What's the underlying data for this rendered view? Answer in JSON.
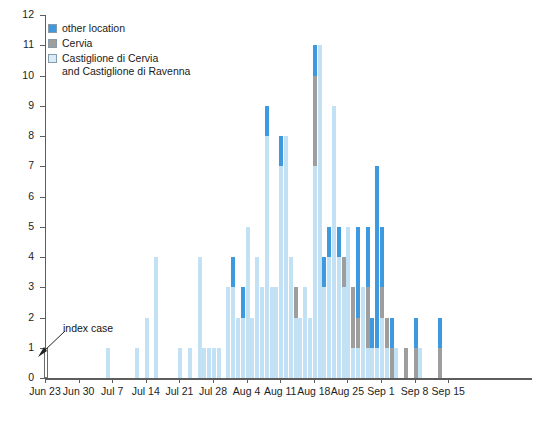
{
  "chart_data": {
    "type": "bar",
    "subtype": "stacked-epidemic-curve",
    "title": "",
    "xlabel": "",
    "ylabel": "number of case",
    "ylim": [
      0,
      12
    ],
    "ytick_values": [
      0,
      1,
      2,
      3,
      4,
      5,
      6,
      7,
      8,
      9,
      10,
      11,
      12
    ],
    "grid": false,
    "legend_position": "top-left",
    "x_start_date": "Jun 23",
    "x_tick_labels": [
      "Jun 23",
      "Jun 30",
      "Jul 7",
      "Jul 14",
      "Jul 21",
      "Jul 28",
      "Aug 4",
      "Aug 11",
      "Aug 18",
      "Aug 25",
      "Sep 1",
      "Sep 8",
      "Sep 15"
    ],
    "x_tick_day_indices": [
      0,
      7,
      14,
      21,
      28,
      35,
      42,
      49,
      56,
      63,
      70,
      77,
      84
    ],
    "series": [
      {
        "name": "Castiglione di Cervia and Castiglione di Ravenna",
        "color": "#c3e1f4"
      },
      {
        "name": "Cervia",
        "color": "#9e9e9e"
      },
      {
        "name": "other location",
        "color": "#3d9ae0"
      }
    ],
    "bars": [
      {
        "day": 0,
        "index_case": 1,
        "castiglione": 0,
        "cervia": 0,
        "other": 0
      },
      {
        "day": 13,
        "castiglione": 1,
        "cervia": 0,
        "other": 0
      },
      {
        "day": 19,
        "castiglione": 1,
        "cervia": 0,
        "other": 0
      },
      {
        "day": 21,
        "castiglione": 2,
        "cervia": 0,
        "other": 0
      },
      {
        "day": 23,
        "castiglione": 4,
        "cervia": 0,
        "other": 0
      },
      {
        "day": 28,
        "castiglione": 1,
        "cervia": 0,
        "other": 0
      },
      {
        "day": 30,
        "castiglione": 1,
        "cervia": 0,
        "other": 0
      },
      {
        "day": 32,
        "castiglione": 4,
        "cervia": 0,
        "other": 0
      },
      {
        "day": 33,
        "castiglione": 1,
        "cervia": 0,
        "other": 0
      },
      {
        "day": 34,
        "castiglione": 1,
        "cervia": 0,
        "other": 0
      },
      {
        "day": 35,
        "castiglione": 1,
        "cervia": 0,
        "other": 0
      },
      {
        "day": 36,
        "castiglione": 1,
        "cervia": 0,
        "other": 0
      },
      {
        "day": 38,
        "castiglione": 3,
        "cervia": 0,
        "other": 0
      },
      {
        "day": 39,
        "castiglione": 3,
        "cervia": 0,
        "other": 1
      },
      {
        "day": 40,
        "castiglione": 2,
        "cervia": 0,
        "other": 0
      },
      {
        "day": 41,
        "castiglione": 2,
        "cervia": 0,
        "other": 1
      },
      {
        "day": 42,
        "castiglione": 5,
        "cervia": 0,
        "other": 0
      },
      {
        "day": 43,
        "castiglione": 2,
        "cervia": 0,
        "other": 0
      },
      {
        "day": 44,
        "castiglione": 4,
        "cervia": 0,
        "other": 0
      },
      {
        "day": 45,
        "castiglione": 3,
        "cervia": 0,
        "other": 0
      },
      {
        "day": 46,
        "castiglione": 8,
        "cervia": 0,
        "other": 1
      },
      {
        "day": 47,
        "castiglione": 3,
        "cervia": 0,
        "other": 0
      },
      {
        "day": 48,
        "castiglione": 3,
        "cervia": 0,
        "other": 0
      },
      {
        "day": 49,
        "castiglione": 7,
        "cervia": 0,
        "other": 1
      },
      {
        "day": 50,
        "castiglione": 8,
        "cervia": 0,
        "other": 0
      },
      {
        "day": 51,
        "castiglione": 4,
        "cervia": 0,
        "other": 0
      },
      {
        "day": 52,
        "castiglione": 2,
        "cervia": 1,
        "other": 0
      },
      {
        "day": 53,
        "castiglione": 2,
        "cervia": 0,
        "other": 0
      },
      {
        "day": 54,
        "castiglione": 3,
        "cervia": 0,
        "other": 0
      },
      {
        "day": 55,
        "castiglione": 2,
        "cervia": 0,
        "other": 0
      },
      {
        "day": 56,
        "castiglione": 7,
        "cervia": 3,
        "other": 1
      },
      {
        "day": 57,
        "castiglione": 11,
        "cervia": 0,
        "other": 0
      },
      {
        "day": 58,
        "castiglione": 3,
        "cervia": 0,
        "other": 1
      },
      {
        "day": 59,
        "castiglione": 4,
        "cervia": 0,
        "other": 1
      },
      {
        "day": 60,
        "castiglione": 9,
        "cervia": 0,
        "other": 0
      },
      {
        "day": 61,
        "castiglione": 4,
        "cervia": 0,
        "other": 1
      },
      {
        "day": 62,
        "castiglione": 3,
        "cervia": 1,
        "other": 0
      },
      {
        "day": 63,
        "castiglione": 5,
        "cervia": 0,
        "other": 0
      },
      {
        "day": 64,
        "castiglione": 1,
        "cervia": 2,
        "other": 0
      },
      {
        "day": 65,
        "castiglione": 1,
        "cervia": 1,
        "other": 3
      },
      {
        "day": 66,
        "castiglione": 3,
        "cervia": 0,
        "other": 0
      },
      {
        "day": 67,
        "castiglione": 1,
        "cervia": 2,
        "other": 2
      },
      {
        "day": 68,
        "castiglione": 1,
        "cervia": 0,
        "other": 1
      },
      {
        "day": 69,
        "castiglione": 1,
        "cervia": 0,
        "other": 6
      },
      {
        "day": 70,
        "castiglione": 2,
        "cervia": 1,
        "other": 2
      },
      {
        "day": 71,
        "castiglione": 1,
        "cervia": 1,
        "other": 0
      },
      {
        "day": 72,
        "castiglione": 0,
        "cervia": 1,
        "other": 1
      },
      {
        "day": 73,
        "castiglione": 1,
        "cervia": 0,
        "other": 0
      },
      {
        "day": 75,
        "castiglione": 0,
        "cervia": 1,
        "other": 0
      },
      {
        "day": 77,
        "castiglione": 0,
        "cervia": 1,
        "other": 1
      },
      {
        "day": 78,
        "castiglione": 1,
        "cervia": 0,
        "other": 0
      },
      {
        "day": 82,
        "castiglione": 0,
        "cervia": 1,
        "other": 1
      }
    ]
  },
  "legend": {
    "items": [
      {
        "label": "other location",
        "swatch": "sw-other"
      },
      {
        "label": "Cervia",
        "swatch": "sw-cervia"
      },
      {
        "label": "Castiglione di Cervia\nand Castiglione di Ravenna",
        "swatch": "sw-cast"
      }
    ]
  },
  "annotation": {
    "index_case_label": "index case"
  }
}
